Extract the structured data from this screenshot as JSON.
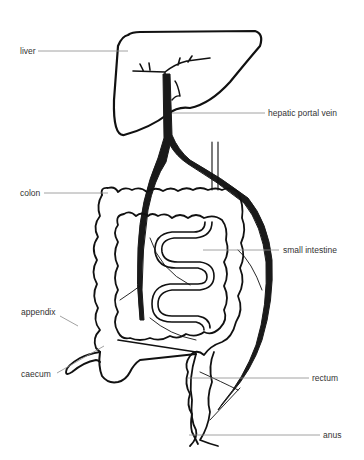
{
  "diagram": {
    "type": "anatomical-illustration",
    "colors": {
      "outline": "#111111",
      "vein": "#1a1a1a",
      "leader_line": "#8a8a8a",
      "label_text": "#333333",
      "background": "#ffffff"
    }
  },
  "labels": {
    "liver": "liver",
    "hepatic_portal_vein": "hepatic portal vein",
    "colon": "colon",
    "small_intestine": "small intestine",
    "appendix": "appendix",
    "caecum": "caecum",
    "rectum": "rectum",
    "anus": "anus"
  }
}
